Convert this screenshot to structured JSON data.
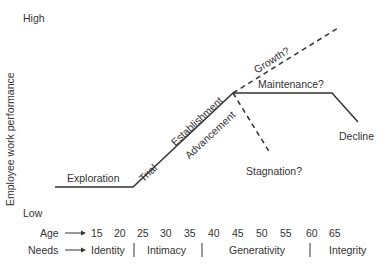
{
  "diagram": {
    "y_axis": {
      "label": "Employee work performance",
      "high": "High",
      "low": "Low"
    },
    "stages": {
      "exploration": "Exploration",
      "trial": "Trial",
      "establishment": "Establishment",
      "advancement": "Advancement",
      "growth": "Growth?",
      "maintenance": "Maintenance?",
      "stagnation": "Stagnation?",
      "decline": "Decline"
    },
    "age_row": {
      "label": "Age",
      "values": [
        "15",
        "20",
        "25",
        "30",
        "35",
        "40",
        "45",
        "50",
        "55",
        "60",
        "65"
      ]
    },
    "needs_row": {
      "label": "Needs",
      "values": [
        "Identity",
        "Intimacy",
        "Generativity",
        "Integrity"
      ],
      "separator": "|"
    },
    "colors": {
      "line": "#333333",
      "text": "#333333",
      "background": "#ffffff"
    }
  }
}
